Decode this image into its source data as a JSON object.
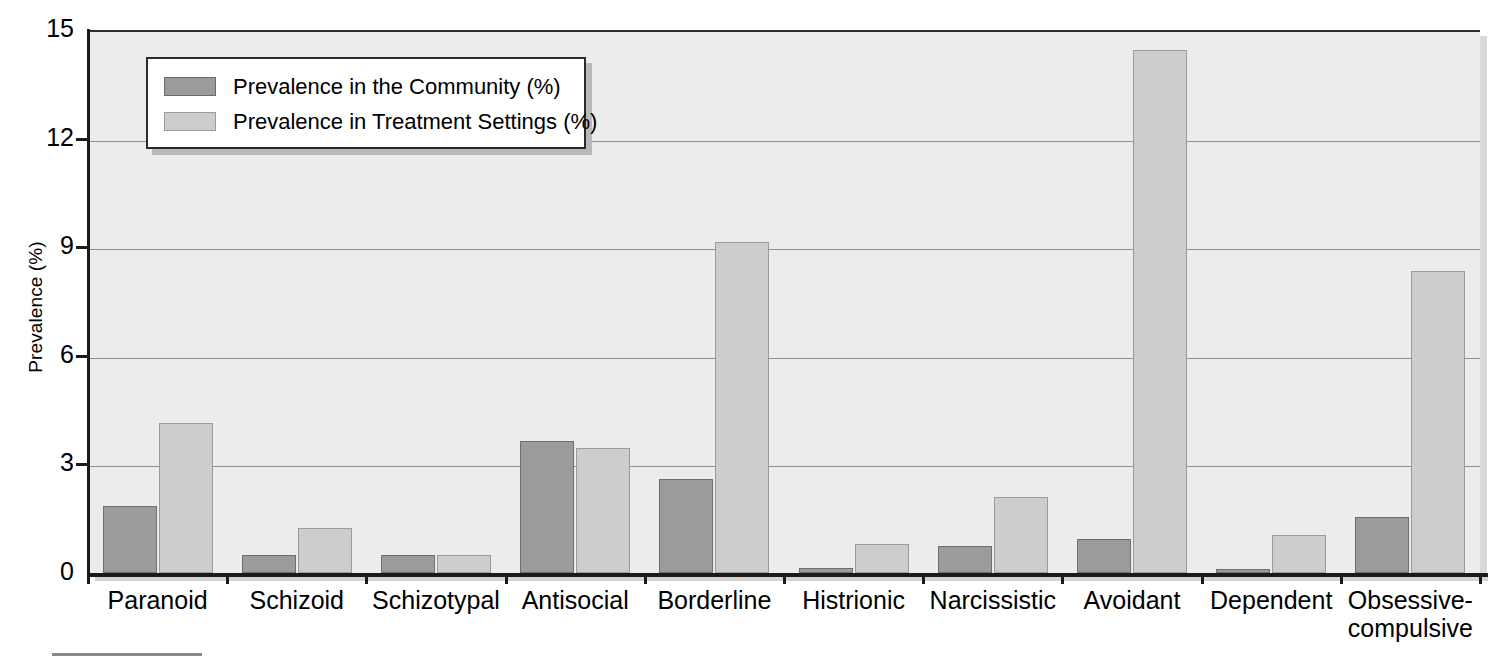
{
  "chart_data": {
    "type": "bar",
    "title": "",
    "xlabel": "",
    "ylabel": "Prevalence (%)",
    "ylim": [
      0,
      15
    ],
    "yticks": [
      0,
      3,
      6,
      9,
      12,
      15
    ],
    "ytick_labels": [
      "0",
      "3",
      "6",
      "9",
      "12",
      "15"
    ],
    "grid": true,
    "grid_axis": "y",
    "legend_position": "upper left inside",
    "categories": [
      "Paranoid",
      "Schizoid",
      "Schizotypal",
      "Antisocial",
      "Borderline",
      "Histrionic",
      "Narcissistic",
      "Avoidant",
      "Dependent",
      "Obsessive-\ncompulsive"
    ],
    "series": [
      {
        "name": "Prevalence in the Community (%)",
        "color": "#9b9b9b",
        "values": [
          1.85,
          0.5,
          0.5,
          3.65,
          2.6,
          0.15,
          0.75,
          0.95,
          0.1,
          1.55
        ]
      },
      {
        "name": "Prevalence in Treatment Settings (%)",
        "color": "#cdcdcd",
        "values": [
          4.15,
          1.25,
          0.5,
          3.45,
          9.15,
          0.8,
          2.1,
          14.45,
          1.05,
          8.35
        ]
      }
    ]
  },
  "legend": {
    "items": [
      {
        "label": "Prevalence in the Community (%)",
        "swatch": "community"
      },
      {
        "label": "Prevalence in Treatment Settings (%)",
        "swatch": "treatment"
      }
    ]
  },
  "axes": {
    "y_title": "Prevalence (%)"
  }
}
